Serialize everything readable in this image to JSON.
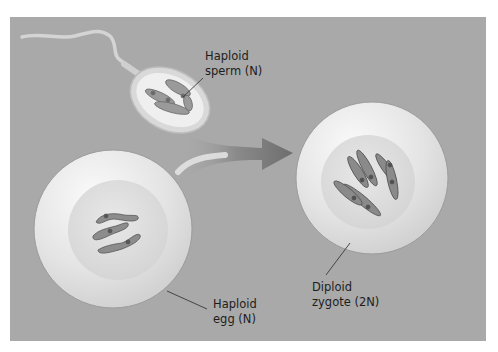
{
  "figure": {
    "background_color": "#a9a9a9",
    "cell_color": "#e6e6e6",
    "chromosome_color": "#5a5a5a"
  },
  "labels": {
    "sperm": {
      "line1": "Haploid",
      "line2": "sperm (N)"
    },
    "egg": {
      "line1": "Haploid",
      "line2": "egg (N)"
    },
    "zygote": {
      "line1": "Diploid",
      "line2": "zygote (2N)"
    }
  },
  "structures": {
    "sperm": {
      "chromosome_count": 3,
      "icon": "sperm-cell-icon"
    },
    "egg": {
      "chromosome_count": 3,
      "icon": "egg-cell-icon"
    },
    "zygote": {
      "chromosome_count": 6,
      "icon": "zygote-cell-icon"
    },
    "arrow": {
      "icon": "arrow-right-icon",
      "meaning": "fusion"
    }
  }
}
